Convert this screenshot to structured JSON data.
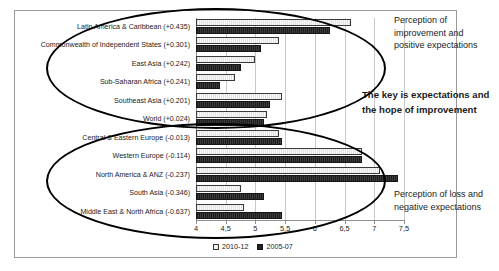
{
  "chart_data": {
    "type": "bar",
    "orientation": "horizontal",
    "title": "",
    "xlabel": "",
    "ylabel": "",
    "xlim": [
      4,
      7.5
    ],
    "grid": true,
    "legend_position": "bottom",
    "tick_labels": [
      "4",
      "4,5",
      "5",
      "5,5",
      "6",
      "6,5",
      "7",
      "7,5"
    ],
    "tick_values": [
      4,
      4.5,
      5,
      5.5,
      6,
      6.5,
      7,
      7.5
    ],
    "categories": [
      "Latin America & Caribbean (+0.435)",
      "Commonwealth of Independent States (+0.301)",
      "East Asia (+0.242)",
      "Sub-Saharan Africa (+0.241)",
      "Southeast Asia (+0.201)",
      "World (+0.024)",
      "Central & Eastern Europe (-0.013)",
      "Western Europe (-0.114)",
      "North America & ANZ (-0.237)",
      "South Asia (-0.346)",
      "Middle East & North Africa (-0.637)"
    ],
    "series": [
      {
        "name": "2010-12",
        "values": [
          6.6,
          5.4,
          5.0,
          4.65,
          5.45,
          5.2,
          5.4,
          6.8,
          7.1,
          4.75,
          4.8
        ]
      },
      {
        "name": "2005-07",
        "values": [
          6.25,
          5.1,
          4.75,
          4.4,
          5.25,
          5.15,
          5.45,
          6.8,
          7.4,
          5.15,
          5.45
        ]
      }
    ],
    "annotations": [
      "Perception of improvement and positive expectations",
      "The key is expectations and the hope of improvement",
      "Perception of loss and negative expectations"
    ]
  },
  "legend": {
    "items": [
      {
        "label": "2010-12"
      },
      {
        "label": "2005-07"
      }
    ]
  },
  "annotations": {
    "top": "Perception of improvement and positive expectations",
    "key": "The key is expectations and the hope of improvement",
    "bottom": "Perception of loss and negative expectations"
  }
}
